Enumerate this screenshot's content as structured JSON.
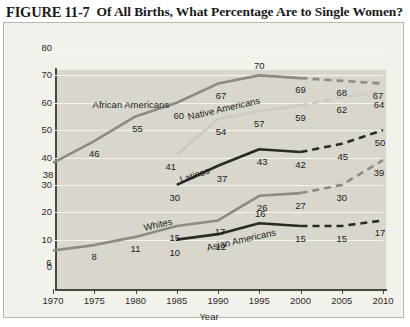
{
  "figure": {
    "number": "FIGURE 11-7",
    "title": "Of All Births, What Percentage Are to Single Women?"
  },
  "chart_data": {
    "type": "line",
    "title": "Of All Births, What Percentage Are to Single Women?",
    "xlabel": "Year",
    "ylabel": "Percent",
    "xlim": [
      1970,
      2010
    ],
    "ylim": [
      0,
      80
    ],
    "yticks": [
      0,
      10,
      20,
      30,
      40,
      50,
      60,
      70,
      80
    ],
    "xticks": [
      1970,
      1975,
      1980,
      1985,
      1990,
      1995,
      2000,
      2005,
      2010
    ],
    "grid": true,
    "legend": "inline-labels",
    "projection_note": "dashed segments after 2000 are projections",
    "series": [
      {
        "name": "African Americans",
        "color": "#8d8a82",
        "label_x": 1974.8,
        "label_y": 61.5,
        "label_rotation": 0,
        "x": [
          1970,
          1975,
          1980,
          1985,
          1990,
          1995,
          2000,
          2005,
          2010
        ],
        "values": [
          38,
          46,
          55,
          60,
          67,
          70,
          69,
          68,
          67
        ],
        "solid_until": 2000,
        "label_offsets": [
          {
            "dx": -5,
            "dy": 11
          },
          {
            "dx": 0,
            "dy": 12
          },
          {
            "dx": 2,
            "dy": 12
          },
          {
            "dx": 2,
            "dy": 12
          },
          {
            "dx": 3,
            "dy": 11
          },
          {
            "dx": 0,
            "dy": -10
          },
          {
            "dx": 0,
            "dy": 11
          },
          {
            "dx": 0,
            "dy": 11
          },
          {
            "dx": -5,
            "dy": 11
          }
        ]
      },
      {
        "name": "Native Americans",
        "color": "#cbc9c2",
        "label_x": 1986.5,
        "label_y": 57.0,
        "label_rotation": -13,
        "x": [
          1985,
          1990,
          1995,
          2000,
          2005,
          2010
        ],
        "values": [
          41,
          54,
          57,
          59,
          62,
          64
        ],
        "solid_until": 2000,
        "label_offsets": [
          {
            "dx": -6,
            "dy": 11
          },
          {
            "dx": 3,
            "dy": 12
          },
          {
            "dx": 0,
            "dy": 12
          },
          {
            "dx": 0,
            "dy": 12
          },
          {
            "dx": 0,
            "dy": 12
          },
          {
            "dx": -4,
            "dy": 12
          }
        ]
      },
      {
        "name": "Latinos",
        "color": "#2b2926",
        "label_x": 1985.6,
        "label_y": 34.0,
        "label_rotation": -19,
        "x": [
          1985,
          1990,
          1995,
          2000,
          2005,
          2010
        ],
        "values": [
          30,
          37,
          43,
          42,
          45,
          50
        ],
        "solid_until": 2000,
        "label_offsets": [
          {
            "dx": -2,
            "dy": 12
          },
          {
            "dx": 4,
            "dy": 12
          },
          {
            "dx": 3,
            "dy": 12
          },
          {
            "dx": 0,
            "dy": 12
          },
          {
            "dx": 1,
            "dy": 12
          },
          {
            "dx": -3,
            "dy": 12
          }
        ]
      },
      {
        "name": "Whites",
        "color": "#8d8a82",
        "label_x": 1981.2,
        "label_y": 16.5,
        "label_rotation": -13,
        "x": [
          1970,
          1975,
          1980,
          1985,
          1990,
          1995,
          2000,
          2005,
          2010
        ],
        "values": [
          6,
          8,
          11,
          15,
          17,
          26,
          27,
          30,
          39
        ],
        "solid_until": 2000,
        "label_offsets": [
          {
            "dx": -4,
            "dy": 11
          },
          {
            "dx": 0,
            "dy": 11
          },
          {
            "dx": 0,
            "dy": 11
          },
          {
            "dx": -2,
            "dy": 11
          },
          {
            "dx": 2,
            "dy": 11
          },
          {
            "dx": 3,
            "dy": 11
          },
          {
            "dx": 0,
            "dy": 12
          },
          {
            "dx": 0,
            "dy": 12
          },
          {
            "dx": -4,
            "dy": 12
          }
        ]
      },
      {
        "name": "Asian Americans",
        "color": "#2b2926",
        "label_x": 1988.8,
        "label_y": 9.0,
        "label_rotation": -13,
        "x": [
          1985,
          1990,
          1995,
          2000,
          2005,
          2010
        ],
        "values": [
          10,
          12,
          16,
          15,
          15,
          17
        ],
        "solid_until": 2000,
        "label_offsets": [
          {
            "dx": -2,
            "dy": 12
          },
          {
            "dx": 3,
            "dy": 12
          },
          {
            "dx": 1,
            "dy": -10
          },
          {
            "dx": 0,
            "dy": 12
          },
          {
            "dx": 0,
            "dy": 12
          },
          {
            "dx": -3,
            "dy": 12
          }
        ]
      }
    ]
  }
}
